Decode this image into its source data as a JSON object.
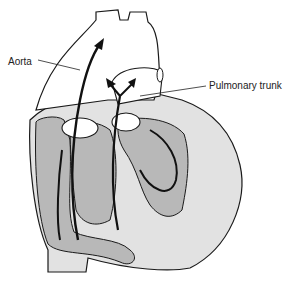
{
  "diagram": {
    "type": "anatomical illustration",
    "labels": {
      "aorta": "Aorta",
      "pulmonary_trunk": "Pulmonary trunk"
    },
    "caption": "",
    "caption_note": "clipped at bottom edge; only tops of glyphs visible",
    "colors": {
      "outline": "#1a1a1a",
      "arrow": "#111111",
      "chamber_dark": "#b8b8b8",
      "wall_light": "#e2e2e2",
      "background": "#ffffff"
    }
  }
}
